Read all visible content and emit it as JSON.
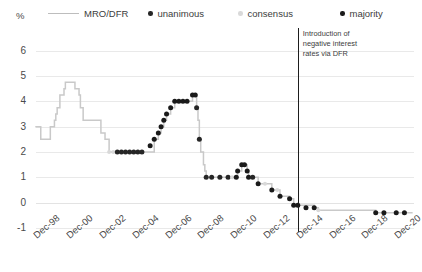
{
  "axis": {
    "y_unit": "%",
    "y_ticks": [
      6,
      5,
      4,
      3,
      2,
      1,
      0,
      -1
    ],
    "x_ticks": [
      "Dec-98",
      "Dec-00",
      "Dec-02",
      "Dec-04",
      "Dec-06",
      "Dec-08",
      "Dec-10",
      "Dec-12",
      "Dec-14",
      "Dec-16",
      "Dec-18",
      "Dec-20"
    ]
  },
  "legend": {
    "items": [
      {
        "label": "MRO/DFR",
        "marker": "line",
        "color": "#bdbdbd"
      },
      {
        "label": "unanimous",
        "marker": "dot",
        "color": "#262626"
      },
      {
        "label": "consensus",
        "marker": "dot",
        "color": "#d9d9d9"
      },
      {
        "label": "majority",
        "marker": "dot",
        "color": "#1a1a1a"
      }
    ]
  },
  "annotation": {
    "text": "Introduction of\nnegative interest\nrates via DFR",
    "at_x": "Dec-14"
  },
  "colors": {
    "line": "#c9c9c9",
    "unanimous": "#262626",
    "consensus": "#d9d9d9",
    "majority": "#1a1a1a",
    "grid": "#e9e9e9",
    "vline": "#1d1d1d"
  },
  "chart_data": {
    "type": "line",
    "title": "",
    "xlabel": "",
    "ylabel": "%",
    "ylim": [
      -1,
      6.5
    ],
    "xlim": [
      "Dec-98",
      "Dec-21"
    ],
    "grid": true,
    "legend_position": "top",
    "series": [
      {
        "name": "MRO/DFR",
        "kind": "step-line",
        "points": [
          {
            "x": "Dec-98",
            "y": 3.0
          },
          {
            "x": "Mar-99",
            "y": 3.0
          },
          {
            "x": "Apr-99",
            "y": 2.5
          },
          {
            "x": "Oct-99",
            "y": 2.5
          },
          {
            "x": "Nov-99",
            "y": 3.0
          },
          {
            "x": "Feb-00",
            "y": 3.25
          },
          {
            "x": "Mar-00",
            "y": 3.5
          },
          {
            "x": "Apr-00",
            "y": 3.75
          },
          {
            "x": "Jun-00",
            "y": 4.25
          },
          {
            "x": "Sep-00",
            "y": 4.5
          },
          {
            "x": "Oct-00",
            "y": 4.75
          },
          {
            "x": "May-01",
            "y": 4.5
          },
          {
            "x": "Aug-01",
            "y": 4.25
          },
          {
            "x": "Sep-01",
            "y": 3.75
          },
          {
            "x": "Nov-01",
            "y": 3.25
          },
          {
            "x": "Dec-02",
            "y": 2.75
          },
          {
            "x": "Mar-03",
            "y": 2.5
          },
          {
            "x": "Jun-03",
            "y": 2.0
          },
          {
            "x": "Dec-05",
            "y": 2.0
          },
          {
            "x": "Mar-06",
            "y": 2.5
          },
          {
            "x": "Jun-06",
            "y": 2.75
          },
          {
            "x": "Aug-06",
            "y": 3.0
          },
          {
            "x": "Oct-06",
            "y": 3.25
          },
          {
            "x": "Dec-06",
            "y": 3.5
          },
          {
            "x": "Mar-07",
            "y": 3.75
          },
          {
            "x": "Jun-07",
            "y": 4.0
          },
          {
            "x": "Jul-08",
            "y": 4.25
          },
          {
            "x": "Oct-08",
            "y": 3.75
          },
          {
            "x": "Nov-08",
            "y": 3.25
          },
          {
            "x": "Dec-08",
            "y": 2.5
          },
          {
            "x": "Jan-09",
            "y": 2.0
          },
          {
            "x": "Mar-09",
            "y": 1.5
          },
          {
            "x": "Apr-09",
            "y": 1.25
          },
          {
            "x": "May-09",
            "y": 1.0
          },
          {
            "x": "Mar-11",
            "y": 1.0
          },
          {
            "x": "Apr-11",
            "y": 1.25
          },
          {
            "x": "Jul-11",
            "y": 1.5
          },
          {
            "x": "Nov-11",
            "y": 1.25
          },
          {
            "x": "Dec-11",
            "y": 1.0
          },
          {
            "x": "Jul-12",
            "y": 0.75
          },
          {
            "x": "May-13",
            "y": 0.5
          },
          {
            "x": "Nov-13",
            "y": 0.25
          },
          {
            "x": "Jun-14",
            "y": 0.15
          },
          {
            "x": "Sep-14",
            "y": -0.1
          },
          {
            "x": "Dec-15",
            "y": -0.2
          },
          {
            "x": "Mar-16",
            "y": -0.3
          },
          {
            "x": "Sep-19",
            "y": -0.4
          },
          {
            "x": "Dec-21",
            "y": -0.4
          }
        ]
      }
    ],
    "decision_markers": [
      {
        "x": "Jun-03",
        "y": 2.0,
        "type": "consensus"
      },
      {
        "x": "Sep-03",
        "y": 2.0,
        "type": "consensus"
      },
      {
        "x": "Dec-03",
        "y": 2.0,
        "type": "unanimous"
      },
      {
        "x": "Mar-04",
        "y": 2.0,
        "type": "unanimous"
      },
      {
        "x": "Jun-04",
        "y": 2.0,
        "type": "unanimous"
      },
      {
        "x": "Sep-04",
        "y": 2.0,
        "type": "unanimous"
      },
      {
        "x": "Dec-04",
        "y": 2.0,
        "type": "unanimous"
      },
      {
        "x": "Mar-05",
        "y": 2.0,
        "type": "unanimous"
      },
      {
        "x": "Jun-05",
        "y": 2.0,
        "type": "unanimous"
      },
      {
        "x": "Dec-05",
        "y": 2.25,
        "type": "majority"
      },
      {
        "x": "Mar-06",
        "y": 2.5,
        "type": "majority"
      },
      {
        "x": "Jun-06",
        "y": 2.75,
        "type": "majority"
      },
      {
        "x": "Aug-06",
        "y": 3.0,
        "type": "majority"
      },
      {
        "x": "Oct-06",
        "y": 3.25,
        "type": "majority"
      },
      {
        "x": "Dec-06",
        "y": 3.5,
        "type": "majority"
      },
      {
        "x": "Mar-07",
        "y": 3.75,
        "type": "majority"
      },
      {
        "x": "Jun-07",
        "y": 4.0,
        "type": "majority"
      },
      {
        "x": "Sep-07",
        "y": 4.0,
        "type": "majority"
      },
      {
        "x": "Dec-07",
        "y": 4.0,
        "type": "majority"
      },
      {
        "x": "Mar-08",
        "y": 4.0,
        "type": "majority"
      },
      {
        "x": "Jul-08",
        "y": 4.25,
        "type": "majority"
      },
      {
        "x": "Sep-08",
        "y": 4.25,
        "type": "majority"
      },
      {
        "x": "Oct-08",
        "y": 3.75,
        "type": "unanimous"
      },
      {
        "x": "Dec-08",
        "y": 2.5,
        "type": "unanimous"
      },
      {
        "x": "May-09",
        "y": 1.0,
        "type": "unanimous"
      },
      {
        "x": "Sep-09",
        "y": 1.0,
        "type": "unanimous"
      },
      {
        "x": "Mar-10",
        "y": 1.0,
        "type": "unanimous"
      },
      {
        "x": "Sep-10",
        "y": 1.0,
        "type": "unanimous"
      },
      {
        "x": "Dec-10",
        "y": 1.0,
        "type": "consensus"
      },
      {
        "x": "Mar-11",
        "y": 1.0,
        "type": "majority"
      },
      {
        "x": "Apr-11",
        "y": 1.25,
        "type": "majority"
      },
      {
        "x": "Jul-11",
        "y": 1.5,
        "type": "majority"
      },
      {
        "x": "Sep-11",
        "y": 1.5,
        "type": "majority"
      },
      {
        "x": "Nov-11",
        "y": 1.25,
        "type": "majority"
      },
      {
        "x": "Dec-11",
        "y": 1.0,
        "type": "majority"
      },
      {
        "x": "Mar-12",
        "y": 1.0,
        "type": "unanimous"
      },
      {
        "x": "Jul-12",
        "y": 0.75,
        "type": "majority"
      },
      {
        "x": "Dec-12",
        "y": 0.75,
        "type": "consensus"
      },
      {
        "x": "May-13",
        "y": 0.5,
        "type": "majority"
      },
      {
        "x": "Sep-13",
        "y": 0.5,
        "type": "consensus"
      },
      {
        "x": "Nov-13",
        "y": 0.25,
        "type": "majority"
      },
      {
        "x": "Jun-14",
        "y": 0.15,
        "type": "majority"
      },
      {
        "x": "Sep-14",
        "y": -0.1,
        "type": "majority"
      },
      {
        "x": "Dec-14",
        "y": -0.1,
        "type": "majority"
      },
      {
        "x": "Jun-15",
        "y": -0.2,
        "type": "majority"
      },
      {
        "x": "Dec-15",
        "y": -0.2,
        "type": "majority"
      },
      {
        "x": "Mar-16",
        "y": -0.3,
        "type": "consensus"
      },
      {
        "x": "Sep-19",
        "y": -0.4,
        "type": "majority"
      },
      {
        "x": "Mar-20",
        "y": -0.4,
        "type": "majority"
      },
      {
        "x": "Dec-20",
        "y": -0.4,
        "type": "majority"
      },
      {
        "x": "Jun-21",
        "y": -0.4,
        "type": "majority"
      }
    ]
  }
}
